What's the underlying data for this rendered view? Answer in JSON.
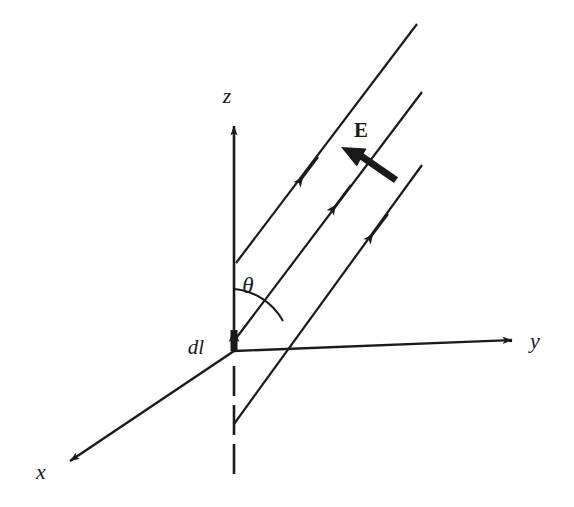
{
  "figure": {
    "background_color": "#ffffff",
    "stroke_color": "#1a1a1a",
    "width": 574,
    "height": 507
  },
  "labels": {
    "z_axis": "z",
    "y_axis": "y",
    "x_axis": "x",
    "angle": "θ",
    "current_element": "dl",
    "field": "E"
  },
  "axes": [
    {
      "name": "z-axis",
      "label": "z",
      "from": [
        234,
        351
      ],
      "to": [
        234,
        118
      ],
      "arrow": true,
      "dashed_tail": {
        "from": [
          234,
          364
        ],
        "to": [
          234,
          478
        ]
      }
    },
    {
      "name": "y-axis",
      "label": "y",
      "from": [
        234,
        351
      ],
      "to": [
        521,
        340
      ],
      "arrow": true
    },
    {
      "name": "x-axis",
      "label": "x",
      "from": [
        234,
        351
      ],
      "to": [
        62,
        466
      ],
      "arrow": true
    }
  ],
  "dipole": {
    "name": "current-element",
    "label": "dl",
    "from": [
      234,
      351
    ],
    "to": [
      234,
      320
    ],
    "arrow": true,
    "thick": true
  },
  "rays": [
    {
      "name": "ray-1",
      "from": [
        236,
        263
      ],
      "to": [
        417,
        24
      ],
      "arrow_at": [
        301,
        180
      ]
    },
    {
      "name": "ray-2",
      "from": [
        234,
        341
      ],
      "to": [
        422,
        92
      ],
      "arrow_at": [
        333,
        208
      ]
    },
    {
      "name": "ray-3",
      "from": [
        234,
        424
      ],
      "to": [
        422,
        165
      ],
      "arrow_at": [
        370,
        237
      ]
    }
  ],
  "field_vector": {
    "name": "electric-field-vector",
    "label": "E",
    "from": [
      394,
      183
    ],
    "to": [
      342,
      147
    ],
    "label_position": [
      352,
      138
    ]
  },
  "angle_arc": {
    "name": "theta-arc",
    "center": [
      234,
      351
    ],
    "radius": 62,
    "start_angle_deg": 90,
    "end_angle_deg": 53,
    "label": "θ",
    "label_position": [
      248,
      293
    ]
  }
}
